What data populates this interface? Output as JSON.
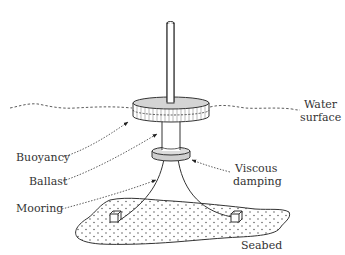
{
  "diagram": {
    "type": "floating spar buoy schematic",
    "labels": {
      "water_surface_line1": "Water",
      "water_surface_line2": "surface",
      "buoyancy": "Buoyancy",
      "ballast": "Ballast",
      "mooring": "Mooring",
      "viscous_damping_line1": "Viscous",
      "viscous_damping_line2": "damping",
      "seabed": "Seabed"
    },
    "components": [
      {
        "id": "mast",
        "description": "Slender vertical cylinder above water"
      },
      {
        "id": "buoyancy-float",
        "description": "Wide disk at water surface"
      },
      {
        "id": "ballast-column",
        "description": "Cylinder below float"
      },
      {
        "id": "damping-plate",
        "description": "Heave plate providing viscous damping"
      },
      {
        "id": "mooring-lines",
        "description": "Two catenary lines to anchors"
      },
      {
        "id": "anchors",
        "description": "Two block anchors on seabed"
      },
      {
        "id": "seabed",
        "description": "Stippled seabed patch"
      }
    ],
    "colors": {
      "line": "#333333",
      "float_top": "#d4d4d4",
      "plate_fill": "#cfcfcf",
      "background": "#ffffff"
    }
  }
}
